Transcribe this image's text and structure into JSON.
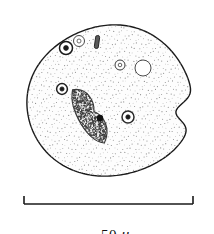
{
  "figure": {
    "domain": "scientific-illustration",
    "background_color": "#ffffff",
    "ink_color": "#1a1a1a"
  },
  "scale_bar": {
    "label_value": "50",
    "label_unit": "μ",
    "label_text": "50 μ",
    "x_start_px": 24,
    "x_end_px": 193,
    "y_px": 204,
    "tick_height_px": 8,
    "line_color": "#1a1a1a"
  },
  "cell": {
    "name": "cell-body",
    "outline_color": "#1a1a1a",
    "fill_color": "#fdfdfd",
    "bounds": {
      "left": 27,
      "top": 25,
      "right": 193,
      "bottom": 176
    },
    "cilia": {
      "name": "cilia-fringe",
      "count": 210,
      "length_px": 11,
      "color": "#2a2a2a"
    },
    "oral_notch": {
      "name": "oral-groove-notch",
      "x_px": 193,
      "y_px": 112
    },
    "stipple": {
      "name": "cytoplasm-stipple",
      "dot_color": "#8d8d8d",
      "dot_radius_px": 0.45,
      "spacing_px": 4.2
    }
  },
  "organelles": [
    {
      "name": "macronucleus",
      "type": "macronucleus",
      "shape": "elongated-bean",
      "fill": "stippled-dark",
      "center_x_px": 89,
      "center_y_px": 116,
      "length_px": 62,
      "width_px": 24,
      "rotation_deg": -32,
      "color": "#3a3a3a"
    },
    {
      "name": "micronucleus",
      "type": "micronucleus",
      "shape": "solid-dot",
      "center_x_px": 100,
      "center_y_px": 118,
      "radius_px": 3.2,
      "color": "#111111"
    },
    {
      "name": "contractile-vacuole-upper-left",
      "type": "vacuole-ringed-dark",
      "center_x_px": 66,
      "center_y_px": 48,
      "radius_px": 6.5,
      "inner_radius_px": 2.4,
      "color": "#1a1a1a"
    },
    {
      "name": "vacuole-upper-mid",
      "type": "vacuole-ring",
      "center_x_px": 79,
      "center_y_px": 41,
      "radius_px": 5.5,
      "inner_radius_px": 2.0,
      "color": "#4a4a4a"
    },
    {
      "name": "rod-body-upper",
      "type": "dark-rod",
      "center_x_px": 97,
      "center_y_px": 42,
      "length_px": 13,
      "width_px": 4,
      "rotation_deg": 8,
      "color": "#222222"
    },
    {
      "name": "vacuole-mid-left",
      "type": "vacuole-ringed-dark",
      "center_x_px": 62,
      "center_y_px": 89,
      "radius_px": 5.4,
      "inner_radius_px": 2.1,
      "color": "#1f1f1f"
    },
    {
      "name": "vacuole-mid-right-small",
      "type": "vacuole-ring",
      "center_x_px": 120,
      "center_y_px": 65,
      "radius_px": 5.0,
      "inner_radius_px": 1.8,
      "color": "#3a3a3a"
    },
    {
      "name": "vacuole-upper-right-large",
      "type": "vacuole-ring",
      "center_x_px": 143,
      "center_y_px": 68,
      "radius_px": 8.0,
      "inner_radius_px": 0,
      "color": "#4a4a4a"
    },
    {
      "name": "vacuole-lower-right",
      "type": "vacuole-ringed-dark",
      "center_x_px": 128,
      "center_y_px": 117,
      "radius_px": 6.0,
      "inner_radius_px": 2.2,
      "color": "#2a2a2a"
    }
  ]
}
